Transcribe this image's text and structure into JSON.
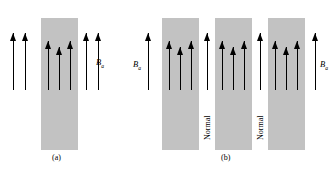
{
  "figure": {
    "type": "physics-diagram",
    "background_color": "#ffffff",
    "slab_color": "#c2c2c2",
    "arrow_color": "#000000"
  },
  "panel_a": {
    "caption": "(a)",
    "field_label": "B",
    "field_subscript": "a",
    "slab": {
      "x": 41,
      "y": 18,
      "width": 37,
      "height": 132
    },
    "arrows_outside_left": [
      {
        "x": 13,
        "top": 33,
        "bottom": 90
      },
      {
        "x": 25,
        "top": 33,
        "bottom": 90
      }
    ],
    "arrows_inside": [
      {
        "x": 48,
        "top": 41,
        "bottom": 90
      },
      {
        "x": 59,
        "top": 47,
        "bottom": 90
      },
      {
        "x": 70,
        "top": 41,
        "bottom": 90
      }
    ],
    "arrows_outside_right": [
      {
        "x": 86,
        "top": 33,
        "bottom": 90
      },
      {
        "x": 98,
        "top": 33,
        "bottom": 90
      }
    ]
  },
  "panel_b": {
    "caption": "(b)",
    "field_label_left": "B",
    "field_subscript_left": "a",
    "field_label_right": "B",
    "field_subscript_right": "a",
    "gap_label_1": "Normal",
    "gap_label_2": "Normal",
    "slabs": [
      {
        "x": 162,
        "y": 18,
        "width": 37,
        "height": 132
      },
      {
        "x": 215,
        "y": 18,
        "width": 37,
        "height": 132
      },
      {
        "x": 268,
        "y": 18,
        "width": 37,
        "height": 132
      }
    ],
    "arrow_left_outside": {
      "x": 148,
      "top": 33,
      "bottom": 90
    },
    "arrows_slab_1": [
      {
        "x": 169,
        "top": 41,
        "bottom": 90
      },
      {
        "x": 180,
        "top": 47,
        "bottom": 90
      },
      {
        "x": 191,
        "top": 41,
        "bottom": 90
      }
    ],
    "arrow_gap_1": {
      "x": 207,
      "top": 33,
      "bottom": 90
    },
    "arrows_slab_2": [
      {
        "x": 222,
        "top": 41,
        "bottom": 90
      },
      {
        "x": 233,
        "top": 47,
        "bottom": 90
      },
      {
        "x": 244,
        "top": 41,
        "bottom": 90
      }
    ],
    "arrow_gap_2": {
      "x": 260,
      "top": 33,
      "bottom": 90
    },
    "arrows_slab_3": [
      {
        "x": 275,
        "top": 41,
        "bottom": 90
      },
      {
        "x": 286,
        "top": 47,
        "bottom": 90
      },
      {
        "x": 297,
        "top": 41,
        "bottom": 90
      }
    ],
    "arrow_right_outside": {
      "x": 315,
      "top": 33,
      "bottom": 90
    }
  }
}
